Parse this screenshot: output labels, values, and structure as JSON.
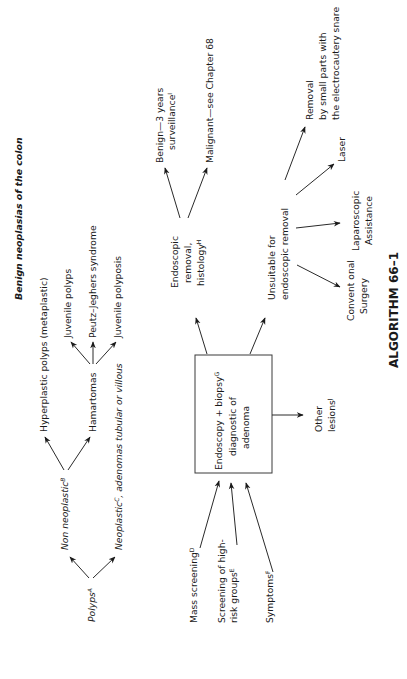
{
  "title": "ALGORITHM 66–1",
  "heading": "Benign neoplasias of the colon",
  "classification": {
    "root": {
      "label": "Polyps",
      "sup": "A"
    },
    "non_neoplastic": {
      "label": "Non neoplastic",
      "sup": "B"
    },
    "neoplastic": {
      "label": "Neoplastic",
      "sup": "C",
      "suffix": ", adenomas tubular or villous"
    },
    "hyperplastic": "Hyperplastic polyps (metaplastic)",
    "hamartomas": "Hamartomas",
    "juvenile_polyps": "Juvenile polyps",
    "peutz": "Peutz–Jeghers syndrome",
    "juvenile_polyposis": "Juvenile polyposis"
  },
  "inputs": {
    "mass_screening": {
      "label": "Mass screening",
      "sup": "D"
    },
    "high_risk_1": "Screening of high-",
    "high_risk_2": {
      "label": "risk groups",
      "sup": "E"
    },
    "symptoms": {
      "label": "Symptoms",
      "sup": "F"
    }
  },
  "center_box": {
    "line1": {
      "label": "Endoscopy + biopsy",
      "sup": "G"
    },
    "line2": "diagnostic of",
    "line3": "adenoma"
  },
  "other_lesions": {
    "line1": "Other",
    "line2": {
      "label": "lesions",
      "sup": "J"
    }
  },
  "endoscopic": {
    "line1": "Endoscopic",
    "line2": "removal,",
    "line3": {
      "label": "histology",
      "sup": "H"
    },
    "benign_1": "Benign—3 years",
    "benign_2": {
      "label": "surveillance",
      "sup": "I"
    },
    "malignant": "Malignant—see Chapter 68"
  },
  "unsuitable": {
    "line1": "Unsuitable  for",
    "line2": "endoscopic removal",
    "conventional_1": "Convent onal",
    "conventional_2": "Surgery",
    "laparoscopic_1": "Laparoscopic",
    "laparoscopic_2": "Assistance",
    "laser": "Laser",
    "removal_1": "Removal",
    "removal_2": "by small parts with",
    "removal_3": "the electrocautery snare"
  }
}
